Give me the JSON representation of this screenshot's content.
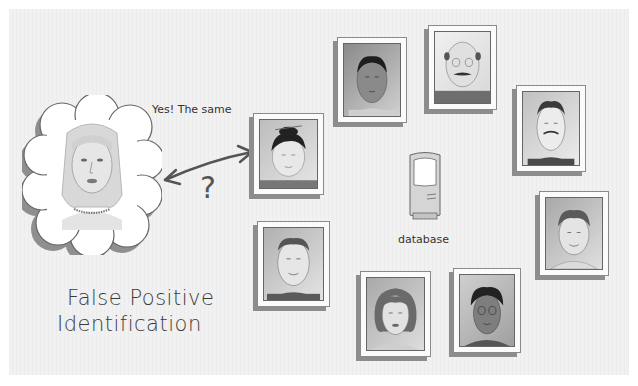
{
  "diagram": {
    "title_lines": [
      "False Positive",
      "Identification"
    ],
    "speech_text": "Yes! The same",
    "question_mark": "?",
    "database_label": "database",
    "subject": {
      "name": "probe-face",
      "description": "woman with long hair and necklace in thought cloud"
    },
    "matched_photo": {
      "name": "matched-photo",
      "description": "person with hair bun"
    },
    "database_photos": [
      {
        "name": "photo-dark-hair-man"
      },
      {
        "name": "photo-bald-glasses-man"
      },
      {
        "name": "photo-mustache-man"
      },
      {
        "name": "photo-curly-hair-man"
      },
      {
        "name": "photo-glasses-woman"
      },
      {
        "name": "photo-curly-hair-woman"
      },
      {
        "name": "photo-short-hair-man"
      }
    ],
    "icons": {
      "arrow": "double-headed-arrow-icon",
      "database": "server-tower-icon"
    },
    "colors": {
      "background": "#f0f0f0",
      "frame": "#fbfbfb",
      "frame_shadow": "#8d8d8d",
      "ink": "#333333"
    }
  }
}
